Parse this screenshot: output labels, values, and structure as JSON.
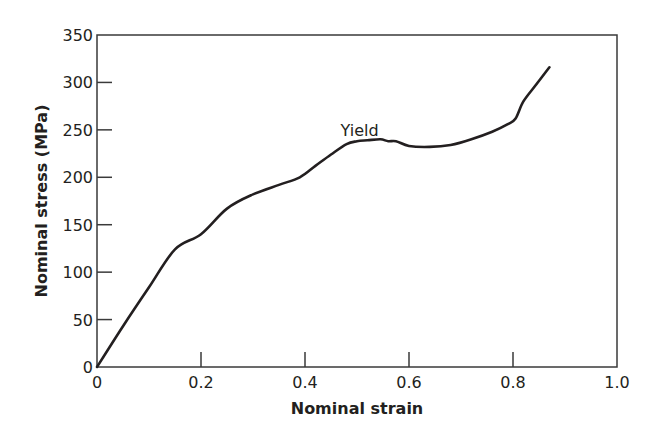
{
  "chart_data": {
    "type": "line",
    "title": "",
    "xlabel": "Nominal strain",
    "ylabel": "Nominal stress (MPa)",
    "xlim": [
      0,
      1.0
    ],
    "ylim": [
      0,
      350
    ],
    "xticks": [
      0,
      0.2,
      0.4,
      0.6,
      0.8,
      1.0
    ],
    "xtick_labels": [
      "0",
      "0.2",
      "0.4",
      "0.6",
      "0.8",
      "1.0"
    ],
    "yticks": [
      0,
      50,
      100,
      150,
      200,
      250,
      300,
      350
    ],
    "ytick_labels": [
      "0",
      "50",
      "100",
      "150",
      "200",
      "250",
      "300",
      "350"
    ],
    "grid": false,
    "legend": null,
    "series": [
      {
        "name": "Stress-strain curve",
        "color": "#231f20",
        "x": [
          0,
          0.05,
          0.1,
          0.15,
          0.2,
          0.25,
          0.3,
          0.35,
          0.39,
          0.42,
          0.45,
          0.48,
          0.5,
          0.52,
          0.545,
          0.56,
          0.575,
          0.6,
          0.64,
          0.68,
          0.72,
          0.76,
          0.79,
          0.805,
          0.82,
          0.845,
          0.87
        ],
        "y": [
          0,
          43,
          84,
          124,
          140,
          167,
          182,
          192,
          200,
          212,
          224,
          235,
          238,
          239,
          240,
          238,
          238,
          233,
          232,
          234,
          240,
          248,
          256,
          262,
          280,
          298,
          316
        ]
      }
    ],
    "annotations": [
      {
        "text": "Yield",
        "x": 0.505,
        "y": 250
      }
    ]
  }
}
